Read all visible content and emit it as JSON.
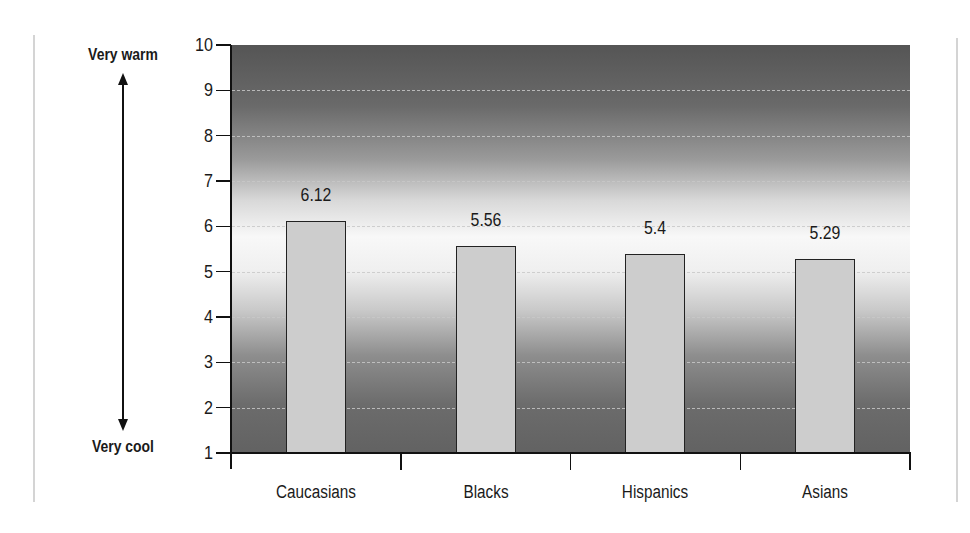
{
  "chart_data": {
    "type": "bar",
    "title": "",
    "xlabel": "",
    "ylabel": "",
    "y_top_label": "Very warm",
    "y_bottom_label": "Very cool",
    "categories": [
      "Caucasians",
      "Blacks",
      "Hispanics",
      "Asians"
    ],
    "values": [
      6.12,
      5.56,
      5.4,
      5.29
    ],
    "value_labels": [
      "6.12",
      "5.56",
      "5.4",
      "5.29"
    ],
    "ylim": [
      1,
      10
    ],
    "yticks": [
      "10",
      "9",
      "8",
      "7",
      "6",
      "5",
      "4",
      "3",
      "2",
      "1"
    ],
    "grid": true,
    "legend": null,
    "colors": {
      "bar_fill": "#cdcdcd",
      "bar_border": "#222222",
      "background_gradient": [
        "#555555",
        "#f8f8f8",
        "#626262"
      ]
    }
  }
}
